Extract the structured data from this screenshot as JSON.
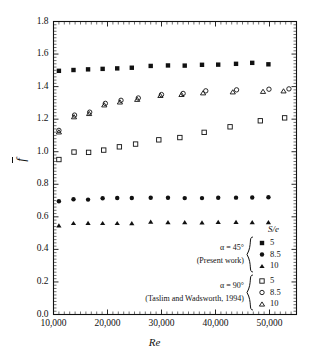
{
  "chart_data": {
    "type": "scatter",
    "title": "",
    "xlabel": "Re",
    "ylabel": "f̅",
    "xlim": [
      10000,
      55000
    ],
    "ylim": [
      0.0,
      1.8
    ],
    "xticks": [
      10000,
      20000,
      30000,
      40000,
      50000
    ],
    "xtick_labels": [
      "10,000",
      "20,000",
      "30,000",
      "40,000",
      "50,000"
    ],
    "yticks": [
      0.0,
      0.2,
      0.4,
      0.6,
      0.8,
      1.0,
      1.2,
      1.4,
      1.6,
      1.8
    ],
    "ytick_labels": [
      "0.0",
      "0.2",
      "0.4",
      "0.6",
      "0.8",
      "1.0",
      "1.2",
      "1.4",
      "1.6",
      "1.8"
    ],
    "grid": false,
    "legend_position": "inside-bottom-right",
    "series": [
      {
        "name": "alpha=45, S/e=5",
        "marker": "filled-square",
        "group": "present-work",
        "se": "5",
        "x": [
          11000,
          13700,
          16400,
          19100,
          21800,
          24500,
          28000,
          31200,
          34300,
          37500,
          40500,
          43800,
          46800,
          49800
        ],
        "y": [
          1.497,
          1.502,
          1.506,
          1.509,
          1.512,
          1.516,
          1.527,
          1.53,
          1.529,
          1.534,
          1.535,
          1.54,
          1.546,
          1.537
        ]
      },
      {
        "name": "alpha=45, S/e=8.5",
        "marker": "filled-circle",
        "group": "present-work",
        "se": "8.5",
        "x": [
          11000,
          13700,
          16400,
          19100,
          21800,
          24500,
          28000,
          31200,
          34300,
          37500,
          40500,
          43800,
          46800,
          49800
        ],
        "y": [
          0.696,
          0.708,
          0.706,
          0.714,
          0.716,
          0.716,
          0.717,
          0.717,
          0.715,
          0.715,
          0.717,
          0.718,
          0.719,
          0.72
        ]
      },
      {
        "name": "alpha=45, S/e=10",
        "marker": "filled-triangle",
        "group": "present-work",
        "se": "10",
        "x": [
          11000,
          13700,
          16400,
          19100,
          21800,
          24500,
          28000,
          31200,
          34300,
          37500,
          40500,
          43800,
          46800,
          49800
        ],
        "y": [
          0.548,
          0.562,
          0.563,
          0.562,
          0.562,
          0.561,
          0.571,
          0.567,
          0.567,
          0.566,
          0.569,
          0.569,
          0.567,
          0.568
        ]
      },
      {
        "name": "alpha=90, S/e=5",
        "marker": "open-square",
        "group": "taslim-wadsworth",
        "se": "5",
        "x": [
          11000,
          13800,
          16500,
          19300,
          22200,
          25200,
          29500,
          33400,
          37900,
          42700,
          48300,
          52800
        ],
        "y": [
          0.952,
          0.998,
          0.996,
          1.01,
          1.03,
          1.047,
          1.073,
          1.087,
          1.119,
          1.153,
          1.19,
          1.208
        ]
      },
      {
        "name": "alpha=90, S/e=8.5",
        "marker": "open-circle",
        "group": "taslim-wadsworth",
        "se": "8.5",
        "x": [
          11000,
          13900,
          16700,
          19600,
          22500,
          25700,
          30000,
          34000,
          38200,
          43900,
          49900,
          53600
        ],
        "y": [
          1.131,
          1.225,
          1.243,
          1.297,
          1.316,
          1.33,
          1.351,
          1.358,
          1.374,
          1.38,
          1.384,
          1.386
        ]
      },
      {
        "name": "alpha=90, S/e=10",
        "marker": "open-triangle",
        "group": "taslim-wadsworth",
        "se": "10",
        "x": [
          11000,
          13800,
          16600,
          19400,
          22300,
          25500,
          29800,
          33700,
          37700,
          43200,
          48800,
          52600
        ],
        "y": [
          1.122,
          1.215,
          1.235,
          1.288,
          1.306,
          1.322,
          1.346,
          1.352,
          1.362,
          1.368,
          1.371,
          1.374
        ]
      }
    ]
  },
  "legend": {
    "header": "S/e",
    "groups": [
      {
        "condition": "α = 45°",
        "source": "(Present work)",
        "entries": [
          {
            "marker": "filled-square",
            "label": "5"
          },
          {
            "marker": "filled-circle",
            "label": "8.5"
          },
          {
            "marker": "filled-triangle",
            "label": "10"
          }
        ]
      },
      {
        "condition": "α = 90°",
        "source": "(Taslim and Wadsworth, 1994)",
        "entries": [
          {
            "marker": "open-square",
            "label": "5"
          },
          {
            "marker": "open-circle",
            "label": "8.5"
          },
          {
            "marker": "open-triangle",
            "label": "10"
          }
        ]
      }
    ]
  },
  "colors": {
    "ink": "#111111",
    "background": "#ffffff"
  }
}
